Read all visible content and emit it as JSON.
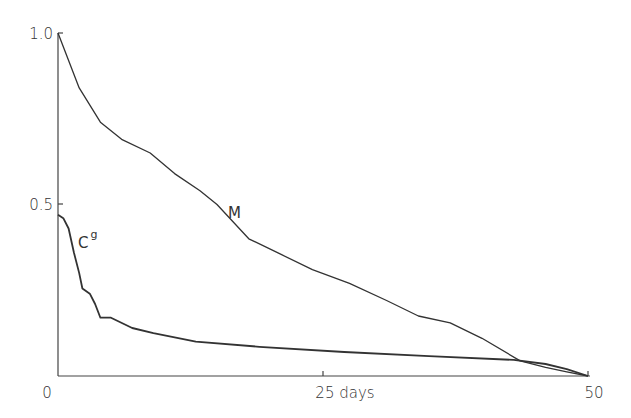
{
  "chart_data": {
    "type": "line",
    "title": "",
    "xlabel": "days",
    "ylabel": "",
    "xlim": [
      0,
      50
    ],
    "ylim": [
      0,
      1.0
    ],
    "grid": false,
    "legend": "inline labels",
    "x_ticks": [
      {
        "value": 0,
        "label": "0"
      },
      {
        "value": 25,
        "label": "25 days"
      },
      {
        "value": 50,
        "label": "50"
      }
    ],
    "y_ticks": [
      {
        "value": 0.5,
        "label": "0.5"
      },
      {
        "value": 1.0,
        "label": "1.0"
      }
    ],
    "series": [
      {
        "name": "M",
        "label": "M",
        "x": [
          0,
          2,
          4,
          6,
          8.7,
          11,
          13.4,
          15,
          18,
          21,
          24,
          27.5,
          31,
          34,
          37,
          40,
          43.6,
          46,
          48,
          50
        ],
        "y": [
          1.0,
          0.84,
          0.74,
          0.69,
          0.65,
          0.59,
          0.54,
          0.5,
          0.4,
          0.355,
          0.31,
          0.27,
          0.22,
          0.175,
          0.155,
          0.11,
          0.044,
          0.025,
          0.012,
          0.0
        ]
      },
      {
        "name": "Cg",
        "label": "C",
        "label_sup": "g",
        "x": [
          0,
          0.5,
          1,
          1.5,
          2,
          2.3,
          3,
          3.5,
          4,
          5,
          7,
          9,
          13,
          19,
          27,
          35,
          43,
          46,
          48,
          50
        ],
        "y": [
          0.47,
          0.46,
          0.43,
          0.36,
          0.3,
          0.255,
          0.24,
          0.21,
          0.17,
          0.17,
          0.14,
          0.125,
          0.1,
          0.085,
          0.07,
          0.058,
          0.047,
          0.035,
          0.02,
          0.0
        ]
      }
    ]
  }
}
